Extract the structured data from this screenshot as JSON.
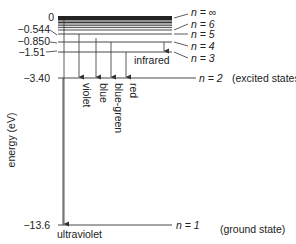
{
  "diagram": {
    "axis_label": "energy (eV)",
    "energy_labels": [
      {
        "id": "e0",
        "text": "0"
      },
      {
        "id": "e6",
        "text": "−0.544"
      },
      {
        "id": "e5",
        "text": "−0.850"
      },
      {
        "id": "e4",
        "text": "−1.51"
      },
      {
        "id": "e2",
        "text": "−3.40"
      },
      {
        "id": "e1",
        "text": "−13.6"
      }
    ],
    "level_labels": [
      {
        "n": "∞",
        "text": "n = ∞"
      },
      {
        "n": "6",
        "text": "n = 6"
      },
      {
        "n": "5",
        "text": "n = 5"
      },
      {
        "n": "4",
        "text": "n = 4"
      },
      {
        "n": "3",
        "text": "n = 3"
      },
      {
        "n": "2",
        "text": "n = 2"
      },
      {
        "n": "1",
        "text": "n = 1"
      }
    ],
    "state_labels": {
      "excited": "(excited states)",
      "ground": "(ground state)"
    },
    "transitions": {
      "violet": "violet",
      "blue": "blue",
      "blue_green": "blue-green",
      "red": "red",
      "infrared": "infrared",
      "ultraviolet": "ultraviolet"
    }
  }
}
